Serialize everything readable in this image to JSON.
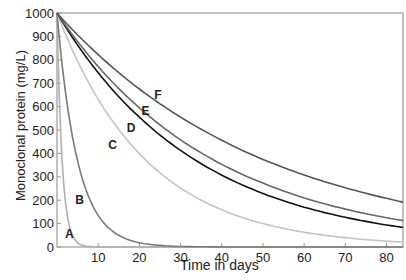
{
  "chart_data": {
    "type": "line",
    "title": "",
    "xlabel": "Time in days",
    "ylabel": "Monoclonal protein (mg/L)",
    "xlim": [
      0,
      84
    ],
    "ylim": [
      0,
      1000
    ],
    "x_ticks": [
      10,
      20,
      30,
      40,
      50,
      60,
      70,
      80
    ],
    "y_ticks": [
      0,
      100,
      200,
      300,
      400,
      500,
      600,
      700,
      800,
      900,
      1000
    ],
    "grid": false,
    "legend": "inline curve labels",
    "x": [
      0,
      2,
      4,
      5,
      6,
      8,
      10,
      15,
      20,
      25,
      30,
      40,
      50,
      60,
      70,
      80,
      84
    ],
    "series": [
      {
        "name": "A",
        "color": "#b0b0b0",
        "label_pos": [
          3,
          55
        ],
        "values": [
          1000,
          202,
          41,
          18,
          8,
          2,
          0,
          0,
          0,
          0,
          0,
          0,
          0,
          0,
          0,
          0,
          0
        ]
      },
      {
        "name": "B",
        "color": "#7a7a7a",
        "label_pos": [
          5.5,
          200
        ],
        "values": [
          1000,
          670,
          449,
          368,
          301,
          202,
          135,
          50,
          18,
          7,
          2,
          0,
          0,
          0,
          0,
          0,
          0
        ]
      },
      {
        "name": "C",
        "color": "#c4c4c4",
        "label_pos": [
          13.5,
          435
        ],
        "values": [
          1000,
          912,
          832,
          795,
          759,
          692,
          631,
          502,
          399,
          317,
          252,
          159,
          100,
          63,
          40,
          25,
          21
        ]
      },
      {
        "name": "D",
        "color": "#111111",
        "label_pos": [
          18,
          510
        ],
        "values": [
          1000,
          943,
          889,
          863,
          838,
          790,
          745,
          642,
          555,
          478,
          413,
          307,
          229,
          170,
          127,
          94,
          84
        ]
      },
      {
        "name": "E",
        "color": "#666666",
        "label_pos": [
          21.5,
          580
        ],
        "values": [
          1000,
          949,
          901,
          878,
          856,
          812,
          771,
          677,
          595,
          522,
          458,
          353,
          273,
          210,
          162,
          125,
          113
        ]
      },
      {
        "name": "F",
        "color": "#555555",
        "label_pos": [
          24.5,
          650
        ],
        "values": [
          1000,
          961,
          924,
          906,
          889,
          855,
          822,
          745,
          675,
          612,
          555,
          456,
          374,
          308,
          253,
          208,
          192
        ]
      }
    ]
  },
  "axes": {
    "xlabel": "Time in days",
    "ylabel": "Monoclonal protein (mg/L)"
  }
}
